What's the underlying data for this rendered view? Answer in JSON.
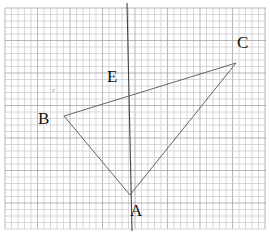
{
  "figure": {
    "type": "geometry-on-grid-paper",
    "background_color": "#ffffff",
    "grid": {
      "x_start": 5,
      "x_end": 266,
      "y_start": 8,
      "y_end": 229,
      "cell_size": 6.5,
      "minor_color": "#c8c8c8",
      "major_color": "#9a9a9a"
    },
    "vertical_line": {
      "x1": 127,
      "y1": 3,
      "x2": 132,
      "y2": 231,
      "color": "#444444"
    },
    "points": [
      {
        "name": "A",
        "x": 130,
        "y": 195,
        "label_x": 130,
        "label_y": 216
      },
      {
        "name": "B",
        "x": 64,
        "y": 116,
        "label_x": 38,
        "label_y": 124
      },
      {
        "name": "C",
        "x": 236,
        "y": 63,
        "label_x": 237,
        "label_y": 48
      },
      {
        "name": "E",
        "x": null,
        "y": null,
        "label_x": 107,
        "label_y": 82
      }
    ],
    "triangle_color": "#555555",
    "stray_mark": {
      "x": 53,
      "y": 90
    }
  },
  "labels": {
    "A": "A",
    "B": "B",
    "C": "C",
    "E": "E"
  }
}
